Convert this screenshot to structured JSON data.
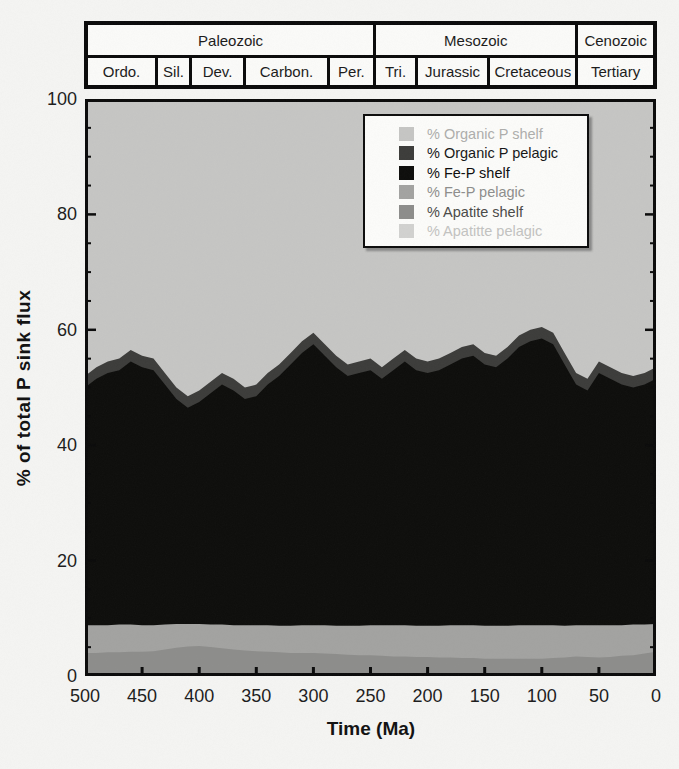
{
  "figure": {
    "background": "#f5f5f3",
    "kind": "scanned stacked-area geochemistry figure"
  },
  "timescale": {
    "eras": [
      {
        "label": "Paleozoic",
        "start_ma": 500,
        "end_ma": 245
      },
      {
        "label": "Mesozoic",
        "start_ma": 245,
        "end_ma": 66
      },
      {
        "label": "Cenozoic",
        "start_ma": 66,
        "end_ma": 0
      }
    ],
    "periods": [
      {
        "label": "Ordo.",
        "start_ma": 500,
        "end_ma": 438
      },
      {
        "label": "Sil.",
        "start_ma": 438,
        "end_ma": 408
      },
      {
        "label": "Dev.",
        "start_ma": 408,
        "end_ma": 360
      },
      {
        "label": "Carbon.",
        "start_ma": 360,
        "end_ma": 286
      },
      {
        "label": "Per.",
        "start_ma": 286,
        "end_ma": 245
      },
      {
        "label": "Tri.",
        "start_ma": 245,
        "end_ma": 208
      },
      {
        "label": "Jurassic",
        "start_ma": 208,
        "end_ma": 144
      },
      {
        "label": "Cretaceous",
        "start_ma": 144,
        "end_ma": 66
      },
      {
        "label": "Tertiary",
        "start_ma": 66,
        "end_ma": 0
      }
    ]
  },
  "chart_data": {
    "type": "area",
    "stacked": true,
    "title": "",
    "xlabel": "Time (Ma)",
    "ylabel": "% of total P sink flux",
    "xlim": [
      500,
      0
    ],
    "ylim": [
      0,
      100
    ],
    "x_axis_reversed": true,
    "grid": false,
    "x_ticks": [
      500,
      450,
      400,
      350,
      300,
      250,
      200,
      150,
      100,
      50,
      0
    ],
    "y_ticks_major": [
      0,
      20,
      40,
      60,
      80,
      100
    ],
    "y_tick_minor_step": 5,
    "x": [
      500,
      490,
      480,
      470,
      460,
      450,
      440,
      430,
      420,
      410,
      400,
      390,
      380,
      370,
      360,
      350,
      340,
      330,
      320,
      310,
      300,
      290,
      280,
      270,
      260,
      250,
      240,
      230,
      220,
      210,
      200,
      190,
      180,
      170,
      160,
      150,
      140,
      130,
      120,
      110,
      100,
      90,
      80,
      70,
      60,
      50,
      40,
      30,
      20,
      10,
      0
    ],
    "series_note": "values are cumulative stack tops in % (layers listed top of legend to bottom of stack); paint order top-to-bottom",
    "series": [
      {
        "name": "% Organic P shelf",
        "color": "#c6c6c4",
        "legend_text_color": "#aeaeac",
        "cumulative_top": [
          100,
          100,
          100,
          100,
          100,
          100,
          100,
          100,
          100,
          100,
          100,
          100,
          100,
          100,
          100,
          100,
          100,
          100,
          100,
          100,
          100,
          100,
          100,
          100,
          100,
          100,
          100,
          100,
          100,
          100,
          100,
          100,
          100,
          100,
          100,
          100,
          100,
          100,
          100,
          100,
          100,
          100,
          100,
          100,
          100,
          100,
          100,
          100,
          100,
          100,
          100
        ]
      },
      {
        "name": "% Organic P pelagic",
        "color": "#3c3c3a",
        "legend_text_color": "#161616",
        "cumulative_top": [
          52.0,
          53.5,
          54.5,
          55.0,
          56.5,
          55.5,
          55.0,
          52.5,
          50.0,
          48.5,
          49.5,
          51.0,
          52.5,
          51.5,
          50.0,
          50.5,
          52.5,
          54.0,
          56.0,
          58.0,
          59.5,
          57.5,
          55.5,
          54.0,
          54.5,
          55.0,
          53.5,
          55.0,
          56.5,
          55.0,
          54.5,
          55.0,
          56.0,
          57.0,
          57.5,
          56.0,
          55.5,
          57.0,
          59.0,
          60.0,
          60.5,
          59.5,
          56.0,
          52.5,
          51.5,
          54.5,
          53.5,
          52.5,
          52.0,
          52.5,
          53.5
        ]
      },
      {
        "name": "% Fe-P shelf",
        "color": "#0d0d0b",
        "legend_text_color": "#0d0d0d",
        "cumulative_top": [
          50.0,
          51.5,
          52.5,
          53.0,
          54.5,
          53.5,
          53.0,
          50.5,
          48.0,
          46.5,
          47.5,
          49.0,
          50.5,
          49.5,
          48.0,
          48.5,
          50.5,
          52.0,
          54.0,
          56.0,
          57.5,
          55.5,
          53.5,
          52.0,
          52.5,
          53.0,
          51.5,
          53.0,
          54.5,
          53.0,
          52.5,
          53.0,
          54.0,
          55.0,
          55.5,
          54.0,
          53.5,
          55.0,
          57.0,
          58.0,
          58.5,
          57.5,
          54.0,
          50.5,
          49.5,
          52.5,
          51.5,
          50.5,
          50.0,
          50.5,
          51.5
        ]
      },
      {
        "name": "% Fe-P pelagic",
        "color": "#a3a3a1",
        "legend_text_color": "#8e8e8c",
        "cumulative_top": [
          8.8,
          8.8,
          8.8,
          8.9,
          8.9,
          8.8,
          8.8,
          8.9,
          9.0,
          9.0,
          9.0,
          8.9,
          8.9,
          8.8,
          8.8,
          8.8,
          8.8,
          8.7,
          8.7,
          8.8,
          8.8,
          8.8,
          8.7,
          8.7,
          8.7,
          8.8,
          8.8,
          8.8,
          8.8,
          8.7,
          8.7,
          8.7,
          8.8,
          8.8,
          8.8,
          8.7,
          8.7,
          8.7,
          8.8,
          8.8,
          8.8,
          8.8,
          8.7,
          8.8,
          8.8,
          8.8,
          8.8,
          8.8,
          8.9,
          8.9,
          9.0
        ]
      },
      {
        "name": "% Apatite shelf",
        "color": "#8d8d8b",
        "legend_text_color": "#4a4a48",
        "cumulative_top": [
          4.0,
          4.0,
          4.1,
          4.1,
          4.2,
          4.2,
          4.3,
          4.6,
          4.9,
          5.1,
          5.2,
          5.0,
          4.8,
          4.6,
          4.4,
          4.3,
          4.2,
          4.1,
          4.0,
          4.0,
          4.0,
          3.9,
          3.8,
          3.7,
          3.6,
          3.6,
          3.5,
          3.4,
          3.4,
          3.3,
          3.3,
          3.2,
          3.2,
          3.1,
          3.1,
          3.0,
          3.0,
          3.0,
          3.0,
          3.0,
          3.0,
          3.1,
          3.2,
          3.4,
          3.3,
          3.2,
          3.3,
          3.5,
          3.6,
          3.9,
          4.2
        ]
      },
      {
        "name": "% Apatitte pelagic",
        "color": "#d2d2d0",
        "legend_text_color": "#c3c3c1",
        "cumulative_top": [
          0.4,
          0.4,
          0.4,
          0.4,
          0.4,
          0.4,
          0.4,
          0.4,
          0.4,
          0.4,
          0.4,
          0.4,
          0.4,
          0.4,
          0.4,
          0.4,
          0.4,
          0.4,
          0.4,
          0.4,
          0.4,
          0.4,
          0.4,
          0.4,
          0.4,
          0.4,
          0.4,
          0.4,
          0.4,
          0.4,
          0.4,
          0.4,
          0.4,
          0.4,
          0.4,
          0.4,
          0.4,
          0.4,
          0.4,
          0.4,
          0.4,
          0.4,
          0.4,
          0.4,
          0.4,
          0.4,
          0.4,
          0.4,
          0.4,
          0.4,
          0.4
        ]
      }
    ],
    "legend": {
      "position": "upper right",
      "entries": [
        "% Organic P shelf",
        "% Organic P pelagic",
        "% Fe-P shelf",
        "% Fe-P pelagic",
        "% Apatite shelf",
        "% Apatitte pelagic"
      ]
    }
  },
  "axes_style": {
    "axis_color": "#0a0a0a",
    "tick_label_color": "#1c1c1c"
  }
}
